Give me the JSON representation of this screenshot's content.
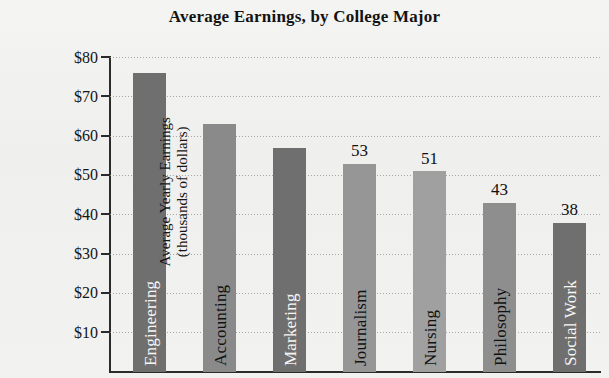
{
  "page": {
    "cut_off_top_line": "",
    "background_color": "#f1f1ef"
  },
  "chart_data": {
    "type": "bar",
    "title": "Average Earnings, by College Major",
    "xlabel": "",
    "ylabel": "Average Yearly Earnings",
    "ylabel_line2": "(thousands of dollars)",
    "categories": [
      "Engineering",
      "Accounting",
      "Marketing",
      "Journalism",
      "Nursing",
      "Philosophy",
      "Social Work"
    ],
    "values": [
      76,
      63,
      57,
      53,
      51,
      43,
      38
    ],
    "value_labels": [
      "",
      "",
      "",
      "53",
      "51",
      "43",
      "38"
    ],
    "bar_colors": [
      "#6f6f6f",
      "#8a8a8a",
      "#6f6f6f",
      "#969696",
      "#a0a0a0",
      "#8e8e8e",
      "#6f6f6f"
    ],
    "bar_label_colors": [
      "light",
      "dark",
      "light",
      "dark",
      "dark",
      "dark",
      "light"
    ],
    "ylim": [
      0,
      80
    ],
    "ytick_labels": [
      "$80",
      "$70",
      "$60",
      "$50",
      "$40",
      "$30",
      "$20",
      "$10"
    ],
    "ytick_values": [
      80,
      70,
      60,
      50,
      40,
      30,
      20,
      10
    ],
    "grid": true,
    "grid_style": "dotted",
    "legend": "none"
  }
}
